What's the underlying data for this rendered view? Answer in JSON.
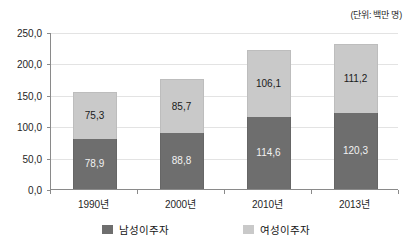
{
  "unit_note": "(단위: 백만 명)",
  "legend": {
    "position": "bottom",
    "items": [
      {
        "key": "male",
        "label": "남성이주자",
        "color": "#6e6e6e"
      },
      {
        "key": "female",
        "label": "여성이주자",
        "color": "#c9c9c9"
      }
    ]
  },
  "axis": {
    "y_ticks": [
      "250,0",
      "200,0",
      "150,0",
      "100,0",
      "50,0",
      "0,0"
    ],
    "x_ticks": [
      "1990년",
      "2000년",
      "2010년",
      "2013년"
    ]
  },
  "chart_data": {
    "type": "bar",
    "stacked": true,
    "title": "",
    "subtitle": "",
    "xlabel": "",
    "ylabel": "",
    "unit": "(단위: 백만 명)",
    "categories": [
      "1990년",
      "2000년",
      "2010년",
      "2013년"
    ],
    "series": [
      {
        "name": "남성이주자",
        "color": "#6e6e6e",
        "values": [
          78.9,
          88.8,
          114.6,
          120.3
        ],
        "labels": [
          "78,9",
          "88,8",
          "114,6",
          "120,3"
        ]
      },
      {
        "name": "여성이주자",
        "color": "#c9c9c9",
        "values": [
          75.3,
          85.7,
          106.1,
          111.2
        ],
        "labels": [
          "75,3",
          "85,7",
          "106,1",
          "111,2"
        ]
      }
    ],
    "totals": [
      154.2,
      174.5,
      220.7,
      231.5
    ],
    "ylim": [
      0,
      250
    ],
    "ytick_values": [
      0,
      50,
      100,
      150,
      200,
      250
    ],
    "ytick_labels": [
      "0,0",
      "50,0",
      "100,0",
      "150,0",
      "200,0",
      "250,0"
    ],
    "grid": true,
    "grid_axis": "y",
    "legend_position": "bottom"
  }
}
